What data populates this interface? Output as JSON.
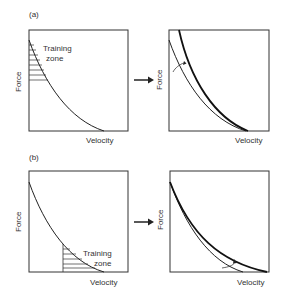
{
  "figure": {
    "panels": [
      {
        "id": "a",
        "label": "(a)",
        "left": {
          "ylabel": "Force",
          "xlabel": "Velocity",
          "zone_label_line1": "Training",
          "zone_label_line2": "zone",
          "zone_region": "high-force / low-velocity"
        },
        "right": {
          "ylabel": "Force",
          "xlabel": "Velocity",
          "shift": "curve shifts up at high-force end"
        }
      },
      {
        "id": "b",
        "label": "(b)",
        "left": {
          "ylabel": "Force",
          "xlabel": "Velocity",
          "zone_label_line1": "Training",
          "zone_label_line2": "zone",
          "zone_region": "low-force / high-velocity"
        },
        "right": {
          "ylabel": "Force",
          "xlabel": "Velocity",
          "shift": "curve shifts out at high-velocity end"
        }
      }
    ],
    "arrow": "right-arrow",
    "colors": {
      "line": "#222222",
      "frame": "#333333",
      "background": "#ffffff"
    }
  }
}
